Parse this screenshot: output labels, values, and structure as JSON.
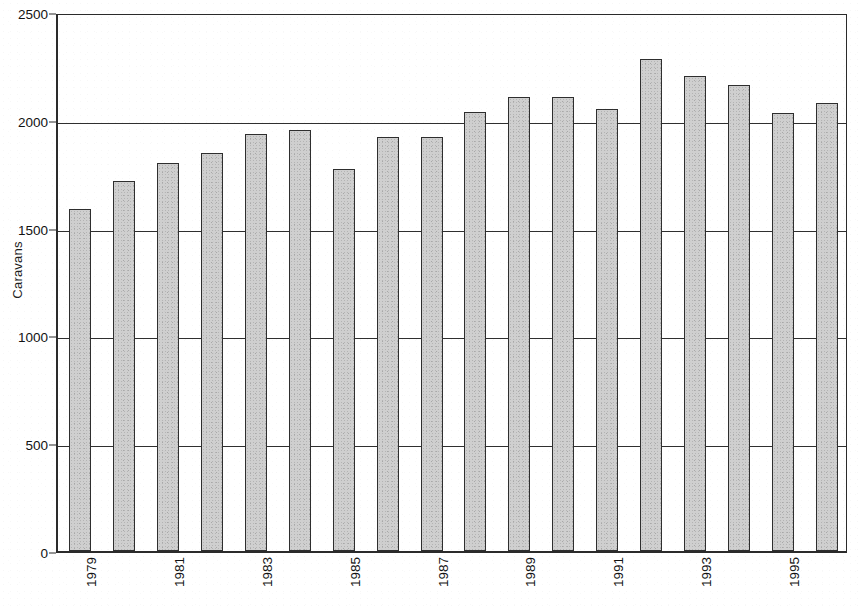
{
  "chart_data": {
    "type": "bar",
    "title": "",
    "xlabel": "",
    "ylabel": "Caravans",
    "ylim": [
      0,
      2500
    ],
    "ytick_values": [
      0,
      500,
      1000,
      1500,
      2000,
      2500
    ],
    "ytick_labels": [
      "0",
      "500",
      "1000",
      "1500",
      "2000",
      "2500"
    ],
    "grid": "horizontal",
    "legend": "none",
    "categories": [
      "1979",
      "1980",
      "1981",
      "1982",
      "1983",
      "1984",
      "1985",
      "1986",
      "1987",
      "1988",
      "1989",
      "1990",
      "1991",
      "1992",
      "1993",
      "1994",
      "1995",
      "1996"
    ],
    "xtick_labels_shown": [
      "1979",
      "",
      "1981",
      "",
      "1983",
      "",
      "1985",
      "",
      "1987",
      "",
      "1989",
      "",
      "1991",
      "",
      "1993",
      "",
      "1995",
      ""
    ],
    "xtick_label_rotation": -90,
    "values": [
      1585,
      1715,
      1800,
      1845,
      1935,
      1955,
      1770,
      1920,
      1920,
      2035,
      2105,
      2105,
      2050,
      2280,
      2205,
      2160,
      2030,
      2080
    ],
    "bar_fill_color": "#cfcfcf",
    "bar_edge_color": "#2e2e2e",
    "axis_color": "#2b2b2b",
    "background_color": "#ffffff"
  }
}
